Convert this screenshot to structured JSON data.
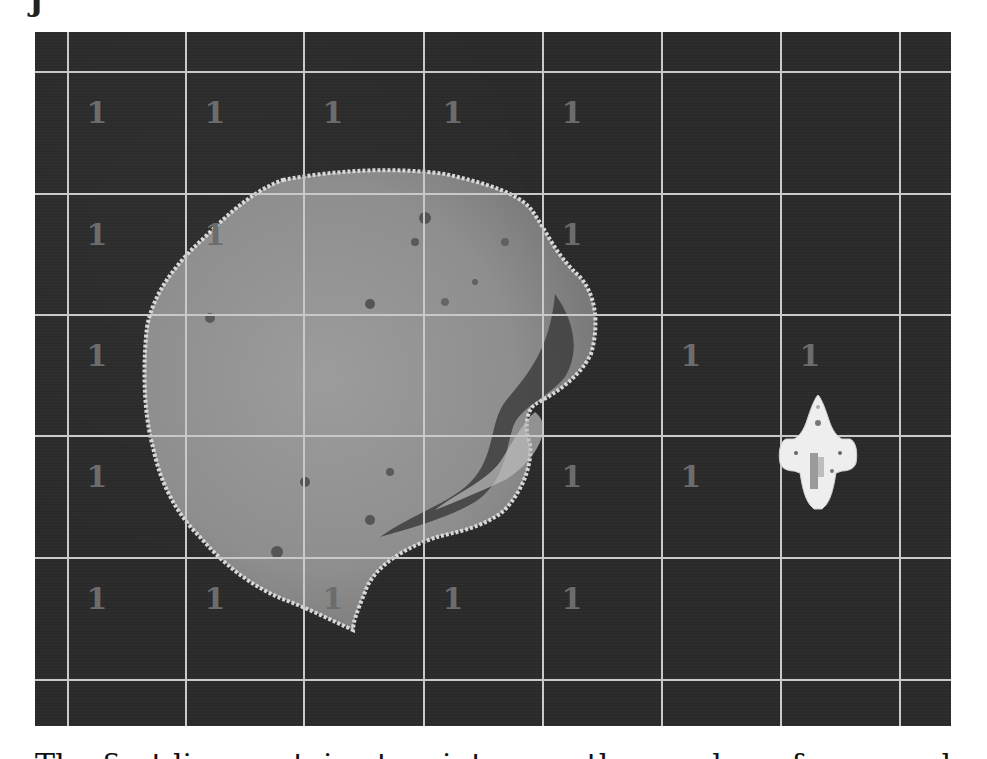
{
  "page": {
    "top_clipped_glyph": "j",
    "caption": "The first line contains two integers, the number of rows and"
  },
  "board": {
    "background_color": "#2b2b2b",
    "grid_line_color": "#c9c9c9",
    "number_color": "#6c6c6c",
    "vertical_lines_x": [
      33,
      151,
      269,
      389,
      508,
      627,
      746,
      865
    ],
    "horizontal_lines_y": [
      40,
      162,
      283,
      404,
      526,
      648
    ],
    "cells": [
      {
        "row": 1,
        "col": 1,
        "value": "1"
      },
      {
        "row": 1,
        "col": 2,
        "value": "1"
      },
      {
        "row": 1,
        "col": 3,
        "value": "1"
      },
      {
        "row": 1,
        "col": 4,
        "value": "1"
      },
      {
        "row": 1,
        "col": 5,
        "value": "1"
      },
      {
        "row": 2,
        "col": 1,
        "value": "1"
      },
      {
        "row": 2,
        "col": 2,
        "value": "1"
      },
      {
        "row": 2,
        "col": 5,
        "value": "1"
      },
      {
        "row": 3,
        "col": 1,
        "value": "1"
      },
      {
        "row": 3,
        "col": 6,
        "value": "1"
      },
      {
        "row": 3,
        "col": 7,
        "value": "1"
      },
      {
        "row": 4,
        "col": 1,
        "value": "1"
      },
      {
        "row": 4,
        "col": 5,
        "value": "1"
      },
      {
        "row": 4,
        "col": 6,
        "value": "1"
      },
      {
        "row": 4,
        "col": 7,
        "value": "1"
      },
      {
        "row": 5,
        "col": 1,
        "value": "1"
      },
      {
        "row": 5,
        "col": 2,
        "value": "1"
      },
      {
        "row": 5,
        "col": 3,
        "value": "1"
      },
      {
        "row": 5,
        "col": 4,
        "value": "1"
      },
      {
        "row": 5,
        "col": 5,
        "value": "1"
      }
    ],
    "sprites": [
      {
        "name": "asteroid",
        "icon": "asteroid-icon"
      },
      {
        "name": "spaceship",
        "icon": "spaceship-icon"
      }
    ]
  }
}
